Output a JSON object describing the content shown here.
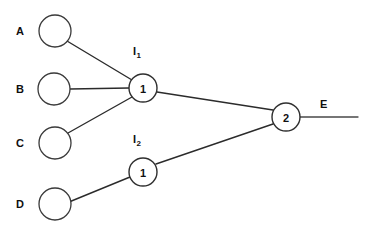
{
  "diagram": {
    "type": "node-link-diagram",
    "background_color": "#ffffff",
    "line_color": "#2b2b2b",
    "node_stroke_color": "#3a3a3a",
    "text_color": "#0f0f0f",
    "canvas": {
      "width": 368,
      "height": 236
    },
    "input_nodes": [
      {
        "id": "A",
        "label": "A",
        "label_x": 16,
        "label_y": 26,
        "cx": 55,
        "cy": 31,
        "r": 16,
        "value": ""
      },
      {
        "id": "B",
        "label": "B",
        "label_x": 16,
        "label_y": 84,
        "cx": 54,
        "cy": 89,
        "r": 16,
        "value": ""
      },
      {
        "id": "C",
        "label": "C",
        "label_x": 16,
        "label_y": 138,
        "cx": 55,
        "cy": 143,
        "r": 16,
        "value": ""
      },
      {
        "id": "D",
        "label": "D",
        "label_x": 16,
        "label_y": 199,
        "cx": 55,
        "cy": 204,
        "r": 16,
        "value": ""
      }
    ],
    "gate_nodes": [
      {
        "id": "I1",
        "name_base": "I",
        "name_sub": "1",
        "name_x": 133,
        "name_y": 46,
        "value": "1",
        "cx": 143,
        "cy": 88,
        "r": 14
      },
      {
        "id": "I2",
        "name_base": "I",
        "name_sub": "2",
        "name_x": 133,
        "name_y": 134,
        "value": "1",
        "cx": 143,
        "cy": 172,
        "r": 14
      },
      {
        "id": "G2",
        "name_base": "",
        "name_sub": "",
        "name_x": 0,
        "name_y": 0,
        "value": "2",
        "cx": 286,
        "cy": 117,
        "r": 14
      }
    ],
    "edges": [
      {
        "id": "A-I1",
        "from": "A",
        "to": "I1",
        "x1": 67,
        "y1": 41,
        "x2": 132,
        "y2": 80
      },
      {
        "id": "B-I1",
        "from": "B",
        "to": "I1",
        "x1": 70,
        "y1": 89,
        "x2": 129,
        "y2": 88
      },
      {
        "id": "C-I1",
        "from": "C",
        "to": "I1",
        "x1": 68,
        "y1": 133,
        "x2": 132,
        "y2": 97
      },
      {
        "id": "D-I2",
        "from": "D",
        "to": "I2",
        "x1": 69,
        "y1": 202,
        "x2": 130,
        "y2": 177
      },
      {
        "id": "I1-G2",
        "from": "I1",
        "to": "G2",
        "x1": 157,
        "y1": 92,
        "x2": 273,
        "y2": 110
      },
      {
        "id": "I2-G2",
        "from": "I2",
        "to": "G2",
        "x1": 156,
        "y1": 164,
        "x2": 273,
        "y2": 124
      }
    ],
    "output": {
      "label": "E",
      "label_x": 320,
      "label_y": 99,
      "line": {
        "x1": 300,
        "y1": 117,
        "x2": 358,
        "y2": 117
      }
    }
  }
}
